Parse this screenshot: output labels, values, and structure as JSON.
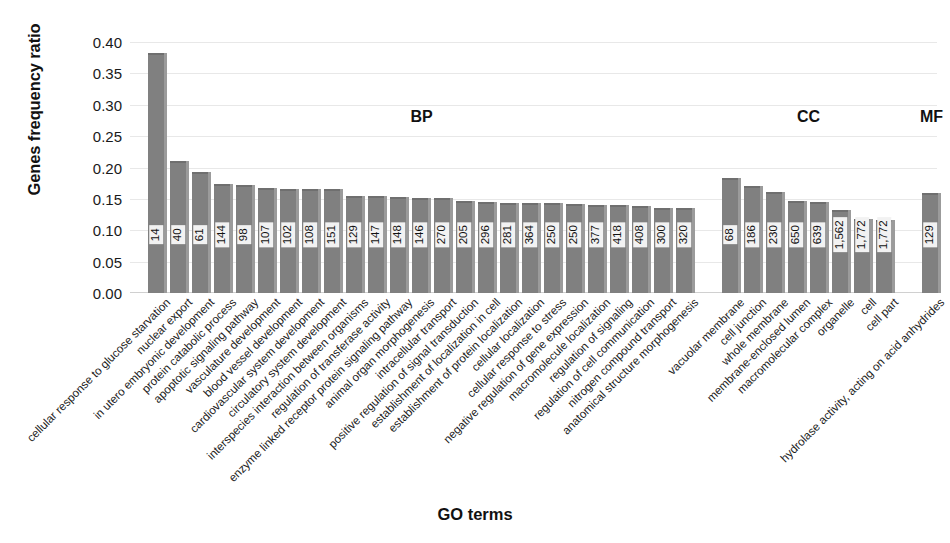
{
  "chart_data": {
    "type": "bar",
    "title": "",
    "xlabel": "GO terms",
    "ylabel": "Genes frequency ratio",
    "ylim": [
      0.0,
      0.4
    ],
    "ytick_labels": [
      "0.40",
      "0.35",
      "0.30",
      "0.25",
      "0.20",
      "0.15",
      "0.10",
      "0.05",
      "0.00"
    ],
    "ytick_values": [
      0.4,
      0.35,
      0.3,
      0.25,
      0.2,
      0.15,
      0.1,
      0.05,
      0.0
    ],
    "grid": true,
    "legend": "none",
    "bar_color": "#808080",
    "bar_edge_color": "#9b9b9b",
    "data_label_background": "#f2f2f2",
    "groups": [
      {
        "name": "BP",
        "label": "BP"
      },
      {
        "name": "CC",
        "label": "CC"
      },
      {
        "name": "MF",
        "label": "MF"
      }
    ],
    "categories": [
      "cellular response to glucose starvation",
      "nuclear export",
      "in utero embryonic development",
      "protein catabolic process",
      "apoptotic signaling pathway",
      "vasculature development",
      "blood vessel development",
      "cardiovascular system development",
      "circulatory system development",
      "interspecies interaction between organisms",
      "regulation of transferase activity",
      "enzyme linked receptor protein signaling pathway",
      "animal organ morphogenesis",
      "intracellular transport",
      "positive regulation of signal transduction",
      "establishment of localization in cell",
      "establishment of protein localization",
      "cellular localization",
      "cellular response to stress",
      "negative regulation of gene expression",
      "macromolecule localization",
      "regulation of signaling",
      "regulation of cell communication",
      "nitrogen compound transport",
      "anatomical structure morphogenesis",
      "vacuolar membrane",
      "cell junction",
      "whole membrane",
      "membrane-enclosed lumen",
      "macromolecular complex",
      "organelle",
      "cell",
      "cell part",
      "hydrolase activity, acting on acid anhydrides"
    ],
    "values": [
      0.383,
      0.21,
      0.193,
      0.173,
      0.172,
      0.167,
      0.166,
      0.166,
      0.165,
      0.155,
      0.154,
      0.153,
      0.152,
      0.151,
      0.146,
      0.145,
      0.144,
      0.143,
      0.143,
      0.142,
      0.141,
      0.14,
      0.139,
      0.136,
      0.135,
      0.184,
      0.171,
      0.161,
      0.147,
      0.145,
      0.132,
      0.118,
      0.117,
      0.16
    ],
    "data_labels": [
      "14",
      "40",
      "61",
      "144",
      "98",
      "107",
      "102",
      "108",
      "151",
      "129",
      "147",
      "148",
      "146",
      "270",
      "205",
      "296",
      "281",
      "364",
      "250",
      "250",
      "377",
      "418",
      "408",
      "300",
      "320",
      "68",
      "186",
      "230",
      "650",
      "639",
      "1,562",
      "1,772",
      "1,772",
      "129"
    ],
    "group_of_bar": [
      "BP",
      "BP",
      "BP",
      "BP",
      "BP",
      "BP",
      "BP",
      "BP",
      "BP",
      "BP",
      "BP",
      "BP",
      "BP",
      "BP",
      "BP",
      "BP",
      "BP",
      "BP",
      "BP",
      "BP",
      "BP",
      "BP",
      "BP",
      "BP",
      "BP",
      "CC",
      "CC",
      "CC",
      "CC",
      "CC",
      "CC",
      "CC",
      "CC",
      "MF"
    ]
  }
}
